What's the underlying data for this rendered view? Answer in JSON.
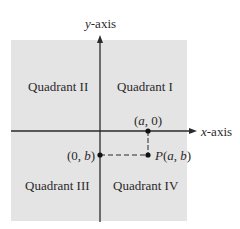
{
  "diagram": {
    "axes": {
      "x_label_var": "x",
      "x_label_rest": "-axis",
      "y_label_var": "y",
      "y_label_rest": "-axis"
    },
    "quadrants": {
      "q1": "Quadrant I",
      "q2": "Quadrant II",
      "q3": "Quadrant III",
      "q4": "Quadrant IV"
    },
    "points": {
      "x_intercept": {
        "open": "(",
        "var": "a",
        "rest": ", 0)"
      },
      "y_intercept": {
        "open": "(0, ",
        "var": "b",
        "close": ")"
      },
      "point_p": {
        "name": "P",
        "open": "(",
        "var1": "a",
        "sep": ", ",
        "var2": "b",
        "close": ")"
      }
    },
    "colors": {
      "plane_fill": "#e4e4e4",
      "axis": "#2a2a2a",
      "text": "#2a2a2a"
    }
  }
}
